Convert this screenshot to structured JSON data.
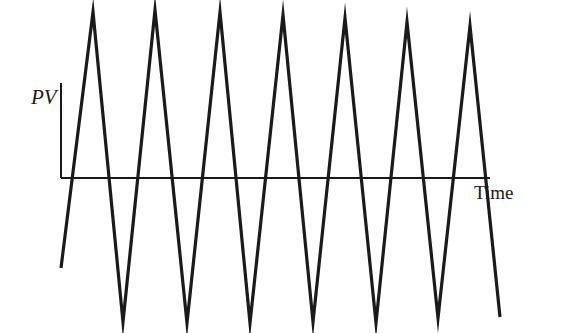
{
  "chart_data": {
    "type": "line",
    "title": "",
    "xlabel": "Time",
    "ylabel": "PV",
    "grid": false,
    "legend": null,
    "axis": {
      "origin": [
        61,
        178
      ],
      "y_axis_top": 83,
      "x_axis_end": 490
    },
    "series": [
      {
        "name": "PV",
        "color": "#1a1a1a",
        "points_px": [
          [
            61,
            268
          ],
          [
            93,
            12
          ],
          [
            123,
            322
          ],
          [
            155,
            10
          ],
          [
            187,
            323
          ],
          [
            220,
            12
          ],
          [
            250,
            323
          ],
          [
            283,
            15
          ],
          [
            313,
            322
          ],
          [
            345,
            18
          ],
          [
            376,
            323
          ],
          [
            407,
            22
          ],
          [
            438,
            318
          ],
          [
            470,
            26
          ],
          [
            500,
            317
          ]
        ]
      }
    ]
  },
  "labels": {
    "y_axis": "PV",
    "x_axis": "Time"
  }
}
